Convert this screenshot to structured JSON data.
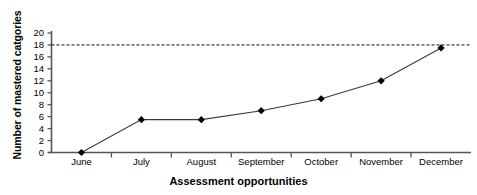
{
  "chart_data": {
    "type": "line",
    "title": "",
    "xlabel": "Assessment opportunities",
    "ylabel": "Number of mastered catgories",
    "categories": [
      "June",
      "July",
      "August",
      "September",
      "October",
      "November",
      "December"
    ],
    "values": [
      0,
      5.5,
      5.5,
      7,
      9,
      12,
      17.5
    ],
    "series": [
      {
        "name": "Mastered categories",
        "values": [
          0,
          5.5,
          5.5,
          7,
          9,
          12,
          17.5
        ]
      }
    ],
    "ylim": [
      0,
      20
    ],
    "yticks": [
      0,
      2,
      4,
      6,
      8,
      10,
      12,
      14,
      16,
      18,
      20
    ],
    "ytick_labels": [
      "0",
      "2",
      "4",
      "6",
      "8",
      "10",
      "12",
      "14",
      "16",
      "18",
      "20"
    ],
    "grid": false,
    "legend": "none",
    "annotations": [
      {
        "type": "horizontal-reference-line",
        "style": "dashed",
        "value": 18,
        "label": ""
      }
    ],
    "marker": "diamond",
    "marker_color": "#000000",
    "line_color": "#3a3a3a"
  }
}
